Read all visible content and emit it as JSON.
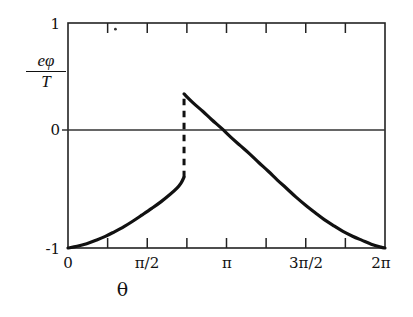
{
  "chart_data": {
    "type": "line",
    "title": "",
    "xlabel": "θ",
    "ylabel_numerator": "eφ",
    "ylabel_denominator": "T",
    "xlim": [
      0,
      6.2831853
    ],
    "ylim": [
      -1,
      1
    ],
    "grid": false,
    "legend": "none",
    "xtick_values": [
      0,
      1.5707963,
      3.1415927,
      4.712389,
      6.2831853
    ],
    "xtick_labels": [
      "0",
      "π/2",
      "π",
      "3π/2",
      "2π"
    ],
    "xminor_tick_values": [
      0.7853982,
      2.3561945,
      3.9269908,
      5.4977871
    ],
    "ytick_values": [
      1,
      0,
      -1
    ],
    "ytick_labels": [
      "1",
      "0",
      "-1"
    ],
    "zero_line": 0,
    "discontinuity": {
      "x": 2.3,
      "y_lower": -0.37,
      "y_upper": 0.37,
      "style": "dashed"
    },
    "series": [
      {
        "name": "branch-left",
        "style": "solid",
        "points": [
          [
            0.0,
            -1.0
          ],
          [
            0.18,
            -0.985
          ],
          [
            0.37,
            -0.962
          ],
          [
            0.55,
            -0.932
          ],
          [
            0.74,
            -0.897
          ],
          [
            0.92,
            -0.856
          ],
          [
            1.11,
            -0.81
          ],
          [
            1.29,
            -0.76
          ],
          [
            1.47,
            -0.706
          ],
          [
            1.66,
            -0.648
          ],
          [
            1.84,
            -0.59
          ],
          [
            2.02,
            -0.525
          ],
          [
            2.16,
            -0.468
          ],
          [
            2.24,
            -0.424
          ],
          [
            2.3,
            -0.37
          ]
        ]
      },
      {
        "name": "branch-right",
        "style": "solid",
        "points": [
          [
            2.3,
            0.37
          ],
          [
            2.48,
            0.29
          ],
          [
            2.67,
            0.215
          ],
          [
            2.85,
            0.14
          ],
          [
            3.04,
            0.065
          ],
          [
            3.22,
            -0.012
          ],
          [
            3.41,
            -0.088
          ],
          [
            3.6,
            -0.163
          ],
          [
            3.78,
            -0.24
          ],
          [
            3.97,
            -0.318
          ],
          [
            4.15,
            -0.396
          ],
          [
            4.34,
            -0.473
          ],
          [
            4.52,
            -0.548
          ],
          [
            4.71,
            -0.62
          ],
          [
            4.9,
            -0.687
          ],
          [
            5.08,
            -0.748
          ],
          [
            5.27,
            -0.803
          ],
          [
            5.45,
            -0.852
          ],
          [
            5.64,
            -0.895
          ],
          [
            5.83,
            -0.932
          ],
          [
            6.01,
            -0.966
          ],
          [
            6.2,
            -0.992
          ],
          [
            6.2831853,
            -1.0
          ]
        ]
      }
    ],
    "annotations": [
      {
        "name": "stray-dot",
        "x": 0.94,
        "y": 0.945
      }
    ]
  },
  "colors": {
    "curve": "#111111",
    "axis": "#222222",
    "background": "#ffffff"
  }
}
